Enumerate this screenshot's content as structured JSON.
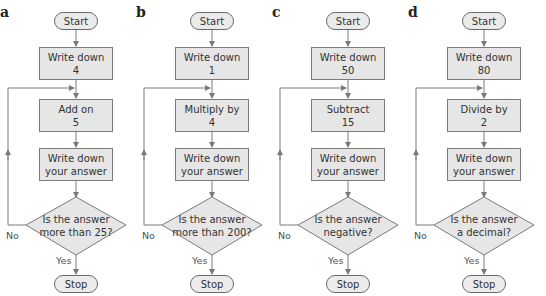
{
  "diagrams": [
    {
      "letter": "a",
      "start": "Start",
      "step1": {
        "line1": "Write down",
        "line2": "4"
      },
      "step2": {
        "line1": "Add on",
        "line2": "5"
      },
      "step3": {
        "line1": "Write down",
        "line2": "your answer"
      },
      "decision": {
        "line1": "Is the answer",
        "line2": "more than 25?"
      },
      "no_label": "No",
      "yes_label": "Yes",
      "stop": "Stop"
    },
    {
      "letter": "b",
      "start": "Start",
      "step1": {
        "line1": "Write down",
        "line2": "1"
      },
      "step2": {
        "line1": "Multiply by",
        "line2": "4"
      },
      "step3": {
        "line1": "Write down",
        "line2": "your answer"
      },
      "decision": {
        "line1": "Is the answer",
        "line2": "more than 200?"
      },
      "no_label": "No",
      "yes_label": "Yes",
      "stop": "Stop"
    },
    {
      "letter": "c",
      "start": "Start",
      "step1": {
        "line1": "Write down",
        "line2": "50"
      },
      "step2": {
        "line1": "Subtract",
        "line2": "15"
      },
      "step3": {
        "line1": "Write down",
        "line2": "your answer"
      },
      "decision": {
        "line1": "Is the answer",
        "line2": "negative?"
      },
      "no_label": "No",
      "yes_label": "Yes",
      "stop": "Stop"
    },
    {
      "letter": "d",
      "start": "Start",
      "step1": {
        "line1": "Write down",
        "line2": "80"
      },
      "step2": {
        "line1": "Divide by",
        "line2": "2"
      },
      "step3": {
        "line1": "Write down",
        "line2": "your answer"
      },
      "decision": {
        "line1": "Is the answer",
        "line2": "a decimal?"
      },
      "no_label": "No",
      "yes_label": "Yes",
      "stop": "Stop"
    }
  ],
  "colors": {
    "box_fill": "#e6e6e6",
    "line": "#7a7a7a"
  }
}
